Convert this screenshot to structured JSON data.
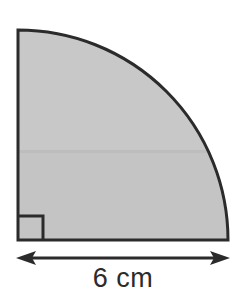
{
  "figure": {
    "shape_name": "quarter-circle",
    "fill_color": "#c8c8c8",
    "fill_color_lower": "#c4c4c4",
    "outline_color": "#2b2b2b",
    "background_color": "#ffffff",
    "seam_color": "#bdbdbd",
    "corner_x": 18,
    "corner_y": 240,
    "radius": 210,
    "right_angle_marker": {
      "name": "right-angle-marker",
      "size": 24
    }
  },
  "dimension": {
    "label": "6 cm",
    "value": 6,
    "unit": "cm",
    "arrow_color": "#2b2b2b",
    "arrow_y": 258,
    "arrow_x_start": 18,
    "arrow_x_end": 228,
    "arrowhead_length": 16,
    "arrowhead_half_width": 7
  }
}
